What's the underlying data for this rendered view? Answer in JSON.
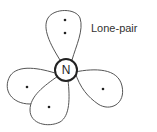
{
  "diagram": {
    "center_atom": "N",
    "annotation": "Lone-pair",
    "lobes": [
      {
        "name": "top",
        "electrons": 2
      },
      {
        "name": "left",
        "electrons": 1
      },
      {
        "name": "bottom",
        "electrons": 1
      },
      {
        "name": "right",
        "electrons": 1
      }
    ],
    "colors": {
      "line": "#444444",
      "background": "#ffffff"
    }
  }
}
